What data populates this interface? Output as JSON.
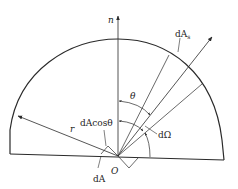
{
  "diagram": {
    "labels": {
      "normal": "n",
      "surface_element_sphere": "dA",
      "surface_element_sphere_sub": "s",
      "theta": "θ",
      "solid_angle": "dΩ",
      "projected_area": "dAcosθ",
      "radius": "r",
      "origin": "O",
      "area_element": "dA"
    },
    "colors": {
      "line": "#2a2a2a",
      "background": "#ffffff"
    }
  }
}
